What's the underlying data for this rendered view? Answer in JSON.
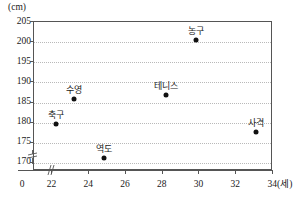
{
  "chart_data": {
    "type": "scatter",
    "title": "",
    "xlabel": "(세)",
    "ylabel": "(cm)",
    "xlim": [
      21,
      34
    ],
    "ylim": [
      168,
      205
    ],
    "grid": true,
    "legend": "none",
    "y_unit_caption": "(cm)",
    "x_unit_caption": "(세)",
    "x_origin_label": "0",
    "y_tick_labels": [
      "205",
      "200",
      "195",
      "190",
      "185",
      "180",
      "175",
      "170"
    ],
    "y_tick_values": [
      205,
      200,
      195,
      190,
      185,
      180,
      175,
      170
    ],
    "x_tick_labels": [
      "22",
      "24",
      "26",
      "28",
      "30",
      "32",
      "34"
    ],
    "x_tick_values": [
      22,
      24,
      26,
      28,
      30,
      32,
      34
    ],
    "axis_break_x": true,
    "axis_break_y": true,
    "points": [
      {
        "label": "축구",
        "x": 22.2,
        "y": 179.7
      },
      {
        "label": "수영",
        "x": 23.2,
        "y": 186.0
      },
      {
        "label": "역도",
        "x": 24.8,
        "y": 171.2
      },
      {
        "label": "테니스",
        "x": 28.2,
        "y": 186.8
      },
      {
        "label": "농구",
        "x": 29.8,
        "y": 200.5
      },
      {
        "label": "사격",
        "x": 33.1,
        "y": 177.7
      }
    ],
    "colors": {
      "point": "#111111",
      "grid": "#b9b9b9",
      "axis": "#555555",
      "text": "#1a1a1a",
      "background": "#ffffff"
    }
  }
}
